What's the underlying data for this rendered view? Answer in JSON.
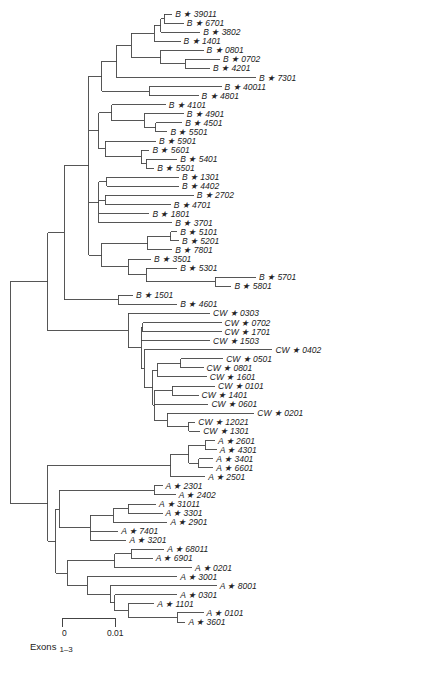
{
  "figure": {
    "scale_bar": {
      "min_label": "0",
      "max_label": "0.01",
      "caption": "Exons",
      "caption_sub": "1–3"
    },
    "star_glyph": "★"
  },
  "tree": {
    "c": [
      {
        "c": [
          {
            "c": [
              {
                "c": [
                  {
                    "c": [
                      {
                        "c": [
                          {
                            "c": [
                              {
                                "c": [
                                  {
                                    "c": [
                                      {
                                        "n": "B ★ 39011",
                                        "l": 10
                                      },
                                      {
                                        "n": "B ★ 6701",
                                        "l": 24
                                      }
                                    ],
                                    "l": 4
                                  },
                                  {
                                    "n": "B ★ 3802",
                                    "l": 48
                                  }
                                ],
                                "l": 8
                              },
                              {
                                "n": "B ★ 1401",
                                "l": 32
                              }
                            ],
                            "l": 28
                          },
                          {
                            "c": [
                              {
                                "n": "B ★ 0801",
                                "l": 52
                              },
                              {
                                "c": [
                                  {
                                    "n": "B ★ 0702",
                                    "l": 42
                                  },
                                  {
                                    "n": "B ★ 4201",
                                    "l": 30
                                  }
                                ],
                                "l": 30
                              }
                            ],
                            "l": 36
                          }
                        ],
                        "l": 18
                      },
                      {
                        "n": "B ★ 7301",
                        "l": 170
                      }
                    ],
                    "l": 18
                  },
                  {
                    "c": [
                      {
                        "n": "B ★ 40011",
                        "l": 88
                      },
                      {
                        "n": "B ★ 4801",
                        "l": 60
                      }
                    ],
                    "l": 58
                  }
                ],
                "l": 16
              },
              {
                "c": [
                  {
                    "c": [
                      {
                        "n": "B ★ 4101",
                        "l": 66
                      },
                      {
                        "c": [
                          {
                            "n": "B ★ 4901",
                            "l": 48
                          },
                          {
                            "c": [
                              {
                                "n": "B ★ 4501",
                                "l": 32
                              },
                              {
                                "n": "B ★ 5501",
                                "l": 14
                              }
                            ],
                            "l": 14
                          }
                        ],
                        "l": 40
                      }
                    ],
                    "l": 16
                  },
                  {
                    "c": [
                      {
                        "n": "B ★ 5901",
                        "l": 62
                      },
                      {
                        "c": [
                          {
                            "n": "B ★ 5601",
                            "l": 10
                          },
                          {
                            "c": [
                              {
                                "n": "B ★ 5401",
                                "l": 38
                              },
                              {
                                "n": "B ★ 5501",
                                "l": 10
                              }
                            ],
                            "l": 6
                          }
                        ],
                        "l": 44
                      }
                    ],
                    "l": 8
                  }
                ],
                "l": 12
              },
              {
                "c": [
                  {
                    "c": [
                      {
                        "n": "B ★ 1301",
                        "l": 88
                      },
                      {
                        "n": "B ★ 4402",
                        "l": 88
                      }
                    ],
                    "l": 10
                  },
                  {
                    "c": [
                      {
                        "n": "B ★ 2702",
                        "l": 108
                      },
                      {
                        "n": "B ★ 4701",
                        "l": 80
                      }
                    ],
                    "l": 8
                  },
                  {
                    "n": "B ★ 1801",
                    "l": 62
                  },
                  {
                    "n": "B ★ 3701",
                    "l": 90
                  }
                ],
                "l": 12
              },
              {
                "c": [
                  {
                    "c": [
                      {
                        "c": [
                          {
                            "n": "B ★ 5101",
                            "l": 8
                          },
                          {
                            "n": "B ★ 5201",
                            "l": 10
                          }
                        ],
                        "l": 28
                      },
                      {
                        "n": "B ★ 7801",
                        "l": 30
                      }
                    ],
                    "l": 56
                  },
                  {
                    "c": [
                      {
                        "n": "B ★ 3501",
                        "l": 28
                      },
                      {
                        "c": [
                          {
                            "n": "B ★ 5301",
                            "l": 38
                          },
                          {
                            "c": [
                              {
                                "n": "B ★ 5701",
                                "l": 50
                              },
                              {
                                "n": "B ★ 5801",
                                "l": 20
                              }
                            ],
                            "l": 84
                          }
                        ],
                        "l": 22
                      }
                    ],
                    "l": 32
                  }
                ],
                "l": 16
              }
            ],
            "l": 30
          },
          {
            "c": [
              {
                "n": "B ★ 1501",
                "l": 18
              },
              {
                "n": "B ★ 4601",
                "l": 72
              }
            ],
            "l": 66
          }
        ],
        "l": 20
      },
      {
        "c": [
          {
            "n": "CW ★ 0303",
            "l": 100
          },
          {
            "c": [
              {
                "c": [
                  {
                    "n": "CW ★ 0702",
                    "l": 96
                  },
                  {
                    "n": "CW ★ 1701",
                    "l": 96
                  }
                ],
                "l": 2
              },
              {
                "n": "CW ★ 1503",
                "l": 84
              },
              {
                "c": [
                  {
                    "n": "CW ★ 0402",
                    "l": 156
                  },
                  {
                    "c": [
                      {
                        "c": [
                          {
                            "c": [
                              {
                                "n": "CW ★ 0501",
                                "l": 52
                              },
                              {
                                "n": "CW ★ 0801",
                                "l": 28
                              }
                            ],
                            "l": 28
                          },
                          {
                            "n": "CW ★ 1601",
                            "l": 60
                          }
                        ],
                        "l": 6
                      },
                      {
                        "c": [
                          {
                            "c": [
                              {
                                "n": "CW ★ 0101",
                                "l": 52
                              },
                              {
                                "n": "CW ★ 1401",
                                "l": 32
                              }
                            ],
                            "l": 22
                          },
                          {
                            "n": "CW ★ 0601",
                            "l": 66
                          },
                          {
                            "c": [
                              {
                                "n": "CW ★ 0201",
                                "l": 106
                              },
                              {
                                "c": [
                                  {
                                    "n": "CW ★ 12021",
                                    "l": 8
                                  },
                                  {
                                    "n": "CW ★ 1301",
                                    "l": 14
                                  }
                                ],
                                "l": 26
                              }
                            ],
                            "l": 16
                          }
                        ],
                        "l": 2
                      }
                    ],
                    "l": 10
                  }
                ],
                "l": 4
              }
            ],
            "l": 16
          }
        ],
        "l": 98
      }
    ],
    "lroot": 46,
    "c2": [
      {
        "c": [
          {
            "c": [
              {
                "c": [
                  {
                    "n": "A ★ 2601",
                    "l": 12
                  },
                  {
                    "n": "A ★ 4301",
                    "l": 14
                  }
                ],
                "l": 20
              },
              {
                "c": [
                  {
                    "n": "A ★ 3401",
                    "l": 18
                  },
                  {
                    "n": "A ★ 6601",
                    "l": 18
                  }
                ],
                "l": 12
              }
            ],
            "l": 22
          },
          {
            "n": "A ★ 2501",
            "l": 42
          }
        ],
        "l": 150
      },
      {
        "c": [
          {
            "c": [
              {
                "c": [
                  {
                    "n": "A ★ 2301",
                    "l": 10
                  },
                  {
                    "n": "A ★ 2402",
                    "l": 26
                  }
                ],
                "l": 116
              },
              {
                "c": [
                  {
                    "c": [
                      {
                        "c": [
                          {
                            "n": "A ★ 31011",
                            "l": 34
                          },
                          {
                            "n": "A ★ 3301",
                            "l": 42
                          }
                        ],
                        "l": 18
                      },
                      {
                        "n": "A ★ 2901",
                        "l": 66
                      }
                    ],
                    "l": 28
                  },
                  {
                    "n": "A ★ 7401",
                    "l": 34
                  },
                  {
                    "n": "A ★ 3201",
                    "l": 44
                  }
                ],
                "l": 38
              }
            ],
            "l": 4
          },
          {
            "c": [
              {
                "c": [
                  {
                    "c": [
                      {
                        "n": "A ★ 68011",
                        "l": 40
                      },
                      {
                        "n": "A ★ 6901",
                        "l": 26
                      }
                    ],
                    "l": 20
                  },
                  {
                    "n": "A ★ 0201",
                    "l": 94
                  }
                ],
                "l": 58
              },
              {
                "c": [
                  {
                    "n": "A ★ 3001",
                    "l": 110
                  },
                  {
                    "c": [
                      {
                        "n": "A ★ 8001",
                        "l": 130
                      },
                      {
                        "c": [
                          {
                            "n": "A ★ 0301",
                            "l": 76
                          },
                          {
                            "c": [
                              {
                                "n": "A ★ 1101",
                                "l": 32
                              },
                              {
                                "c": [
                                  {
                                    "n": "A ★ 0101",
                                    "l": 32
                                  },
                                  {
                                    "n": "A ★ 3601",
                                    "l": 10
                                  }
                                ],
                                "l": 60
                              }
                            ],
                            "l": 16
                          }
                        ],
                        "l": 6
                      }
                    ],
                    "l": 28
                  }
                ],
                "l": 24
              }
            ],
            "l": 14
          }
        ],
        "l": 10
      }
    ]
  }
}
